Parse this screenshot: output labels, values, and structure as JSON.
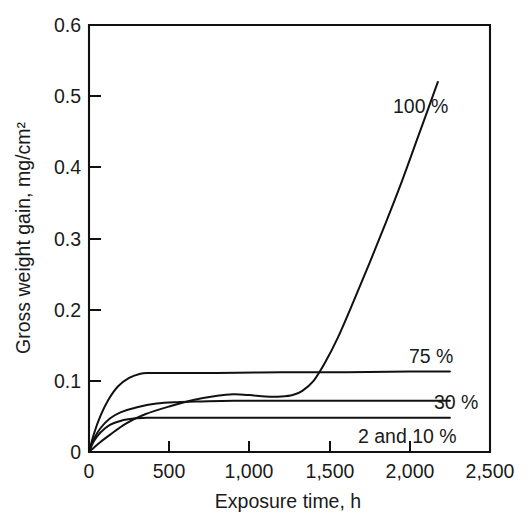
{
  "figure": {
    "background_color": "#ffffff",
    "line_color": "#111111",
    "text_color": "#1a1a1a"
  },
  "axes": {
    "x_title": "Exposure time, h",
    "y_title": "Gross weight gain, mg/cm²",
    "x_ticks": [
      "0",
      "500",
      "1,000",
      "1,500",
      "2,000",
      "2,500"
    ],
    "y_ticks": [
      "0",
      "0.1",
      "0.2",
      "0.3",
      "0.4",
      "0.5",
      "0.6"
    ]
  },
  "series_labels": {
    "s100": "100 %",
    "s75": "75 %",
    "s30": "30 %",
    "s2and10": "2 and 10 %"
  },
  "chart_data": {
    "type": "line",
    "title": "",
    "xlabel": "Exposure time, h",
    "ylabel": "Gross weight gain, mg/cm²",
    "xlim": [
      0,
      2500
    ],
    "ylim": [
      0,
      0.6
    ],
    "xticks": [
      0,
      500,
      1000,
      1500,
      2000,
      2500
    ],
    "yticks": [
      0,
      0.1,
      0.2,
      0.3,
      0.4,
      0.5,
      0.6
    ],
    "xtick_labels": [
      "0",
      "500",
      "1,000",
      "1,500",
      "2,000",
      "2,500"
    ],
    "ytick_labels": [
      "0",
      "0.1",
      "0.2",
      "0.3",
      "0.4",
      "0.5",
      "0.6"
    ],
    "grid": false,
    "legend": "inline-right-end-labels",
    "series": [
      {
        "name": "100 %",
        "label": "100 %",
        "color": "#111111",
        "x": [
          0,
          60,
          130,
          230,
          350,
          500,
          650,
          800,
          900,
          1000,
          1100,
          1200,
          1270,
          1330,
          1400,
          1470,
          1550,
          1650,
          1750,
          1850,
          1950,
          2050,
          2175
        ],
        "y": [
          0.0,
          0.012,
          0.024,
          0.04,
          0.053,
          0.064,
          0.073,
          0.079,
          0.081,
          0.08,
          0.078,
          0.078,
          0.08,
          0.086,
          0.1,
          0.125,
          0.16,
          0.212,
          0.266,
          0.322,
          0.38,
          0.442,
          0.52
        ]
      },
      {
        "name": "75 %",
        "label": "75 %",
        "color": "#111111",
        "x": [
          0,
          30,
          70,
          120,
          180,
          250,
          320,
          380,
          500,
          800,
          1200,
          1600,
          2000,
          2250
        ],
        "y": [
          0.0,
          0.025,
          0.05,
          0.073,
          0.092,
          0.104,
          0.11,
          0.111,
          0.111,
          0.111,
          0.112,
          0.112,
          0.113,
          0.113
        ]
      },
      {
        "name": "30 %",
        "label": "30 %",
        "color": "#111111",
        "x": [
          0,
          30,
          70,
          130,
          200,
          300,
          420,
          550,
          700,
          900,
          1200,
          1600,
          2000,
          2250
        ],
        "y": [
          0.0,
          0.018,
          0.033,
          0.047,
          0.056,
          0.063,
          0.068,
          0.07,
          0.071,
          0.072,
          0.072,
          0.072,
          0.072,
          0.072
        ]
      },
      {
        "name": "2 and 10 %",
        "label": "2 and 10 %",
        "color": "#111111",
        "x": [
          0,
          30,
          70,
          130,
          200,
          280,
          360,
          450,
          600,
          900,
          1300,
          1700,
          2000,
          2250
        ],
        "y": [
          0.0,
          0.015,
          0.027,
          0.038,
          0.044,
          0.047,
          0.048,
          0.048,
          0.048,
          0.048,
          0.048,
          0.048,
          0.048,
          0.048
        ]
      }
    ],
    "annotations": [
      {
        "text": "100 %",
        "x": 1900,
        "y": 0.468
      },
      {
        "text": "75 %",
        "x": 2120,
        "y": 0.137
      },
      {
        "text": "30 %",
        "x": 2300,
        "y": 0.078
      },
      {
        "text": "2 and 10 %",
        "x": 2060,
        "y": 0.02
      }
    ]
  }
}
